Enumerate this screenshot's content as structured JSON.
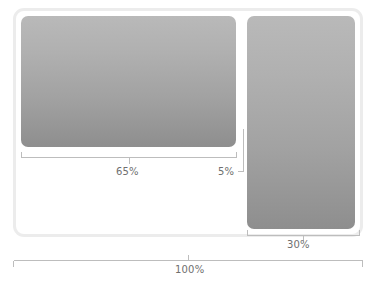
{
  "diagram": {
    "type": "proportional-layout-annotation",
    "colors": {
      "frame_border": "#ececec",
      "panel_gradient_top": "#b9b9b9",
      "panel_gradient_bottom": "#8e8e8e",
      "measure_line": "#bdbdbd",
      "label_text": "#6f6f6f",
      "background": "#ffffff"
    },
    "frame": {
      "name": "outer-frame"
    },
    "panels": [
      {
        "name": "main-panel",
        "measure": "65%"
      },
      {
        "name": "side-panel",
        "measure": "30%"
      }
    ],
    "measurements": [
      {
        "id": "main-width",
        "label": "65%",
        "value": 65,
        "unit": "%",
        "target": "main-panel",
        "bracket": "horizontal-up",
        "position": "below-main-panel"
      },
      {
        "id": "gutter-width",
        "label": "5%",
        "value": 5,
        "unit": "%",
        "target": "gutter",
        "bracket": "leader-line",
        "position": "between-panels"
      },
      {
        "id": "side-width",
        "label": "30%",
        "value": 30,
        "unit": "%",
        "target": "side-panel",
        "bracket": "horizontal-up",
        "position": "below-side-panel"
      },
      {
        "id": "total-width",
        "label": "100%",
        "value": 100,
        "unit": "%",
        "target": "outer-frame",
        "bracket": "horizontal-down",
        "position": "below-frame"
      }
    ]
  }
}
